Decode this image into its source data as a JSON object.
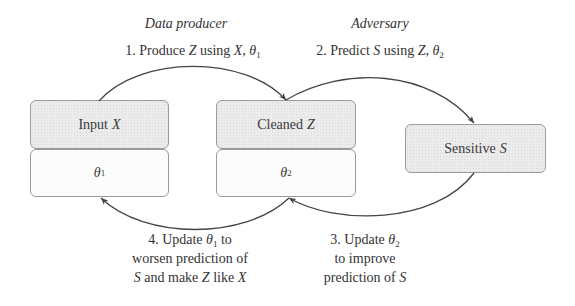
{
  "diagram": {
    "roles": {
      "producer": "Data producer",
      "adversary": "Adversary"
    },
    "steps": {
      "step1": {
        "prefix": "1. Produce ",
        "var1": "Z",
        "mid": " using ",
        "var2": "X",
        "sep": ", ",
        "theta": "θ",
        "sub": "1"
      },
      "step2": {
        "prefix": "2. Predict ",
        "var1": "S",
        "mid": " using ",
        "var2": "Z",
        "sep": ", ",
        "theta": "θ",
        "sub": "2"
      },
      "step3": {
        "line1_prefix": "3. Update ",
        "line1_theta": "θ",
        "line1_sub": "2",
        "line2": "to improve",
        "line3_prefix": "prediction of ",
        "line3_var": "S"
      },
      "step4": {
        "line1_prefix": "4. Update ",
        "line1_theta": "θ",
        "line1_sub": "1",
        "line1_suffix": " to",
        "line2": "worsen prediction of",
        "line3_var1": "S",
        "line3_mid": " and make ",
        "line3_var2": "Z",
        "line3_mid2": " like ",
        "line3_var3": "X"
      }
    },
    "nodes": {
      "input": {
        "label": "Input",
        "var": "X"
      },
      "theta1": {
        "theta": "θ",
        "sub": "1"
      },
      "cleaned": {
        "label": "Cleaned",
        "var": "Z"
      },
      "theta2": {
        "theta": "θ",
        "sub": "2"
      },
      "sensitive": {
        "label": "Sensitive",
        "var": "S"
      }
    },
    "edges": [
      {
        "from": "input",
        "to": "cleaned",
        "label": "step1"
      },
      {
        "from": "cleaned",
        "to": "sensitive",
        "label": "step2"
      },
      {
        "from": "sensitive",
        "to": "theta2",
        "label": "step3"
      },
      {
        "from": "theta2",
        "to": "theta1",
        "label": "step4"
      }
    ],
    "colors": {
      "shaded_fill": "#ececec",
      "plain_fill": "#fcfcfc",
      "border": "#9a9a9a",
      "arrow": "#444444",
      "text": "#333333"
    }
  }
}
